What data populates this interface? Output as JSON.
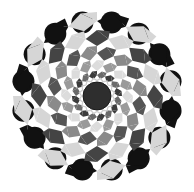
{
  "image": {
    "description": "Geometric rosette of overlapping circles in grayscale",
    "width": 194,
    "height": 192,
    "center": [
      97,
      96
    ],
    "outer_radius": 84,
    "lobes": 16,
    "core_radius": 14,
    "colors": {
      "background": "#ffffff",
      "outer_dark": "#111111",
      "light": "#d6d6d6",
      "mid_dark": "#4a4a4a",
      "mid": "#7a7a7a",
      "mid_light": "#a8a8a8",
      "core": "#2e2e2e",
      "core_ring": "#cfcfcf"
    },
    "rings": [
      {
        "r0": 66,
        "r1": 84,
        "a": "#111111",
        "b": "#d6d6d6"
      },
      {
        "r0": 50,
        "r1": 66,
        "a": "#d6d6d6",
        "b": "#444444"
      },
      {
        "r0": 36,
        "r1": 50,
        "a": "#555555",
        "b": "#8a8a8a"
      },
      {
        "r0": 25,
        "r1": 36,
        "a": "#9a9a9a",
        "b": "#dcdcdc"
      },
      {
        "r0": 17,
        "r1": 25,
        "a": "#6a6a6a",
        "b": "#3c3c3c"
      }
    ]
  }
}
